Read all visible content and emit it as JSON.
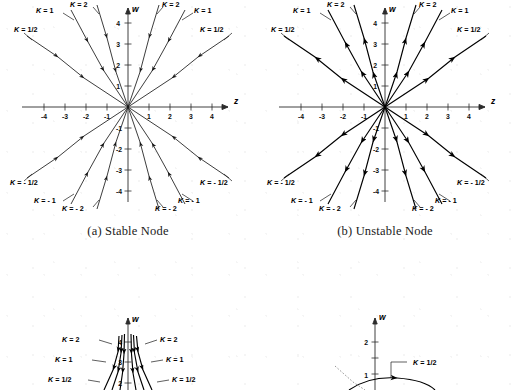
{
  "figure": {
    "background_color": "#ffffff",
    "ink_color": "#000000",
    "panels": [
      {
        "id": "a",
        "caption": "(a) Stable Node",
        "type": "phase-portrait",
        "axis_x_label": "z",
        "axis_y_label": "w",
        "x_ticks": [
          "-4",
          "-3",
          "-2",
          "-1",
          "1",
          "2",
          "3",
          "4"
        ],
        "y_ticks": [
          "4",
          "3",
          "2",
          "1",
          "-1",
          "-2",
          "-3",
          "-4"
        ],
        "flow_direction": "inward",
        "curve_labels": [
          "K = 1/2",
          "K = 1",
          "K = 2",
          "K = 2",
          "K = 1",
          "K = 1/2",
          "K = - 1/2",
          "K = - 1",
          "K = - 2",
          "K = - 2",
          "K = - 1",
          "K = - 1/2"
        ]
      },
      {
        "id": "b",
        "caption": "(b) Unstable Node",
        "type": "phase-portrait",
        "axis_x_label": "z",
        "axis_y_label": "w",
        "x_ticks": [
          "-4",
          "-3",
          "-2",
          "-1",
          "1",
          "2",
          "3",
          "4"
        ],
        "y_ticks": [
          "4",
          "3",
          "2",
          "1",
          "-1",
          "-2",
          "-3",
          "-4"
        ],
        "flow_direction": "outward",
        "curve_labels": [
          "K = 1/2",
          "K = 1",
          "K = 2",
          "K = 2",
          "K = 1",
          "K = 1/2",
          "K = - 1/2",
          "K = - 1",
          "K = - 2",
          "K = - 2",
          "K = - 1",
          "K = - 1/2"
        ]
      },
      {
        "id": "c",
        "caption": "",
        "type": "phase-portrait-partial",
        "axis_y_label": "w",
        "y_ticks": [
          "4",
          "3",
          "2"
        ],
        "curve_labels": [
          "K = 2",
          "K = 1",
          "K = 1/2",
          "K = 2",
          "K = 1",
          "K = 1/2"
        ]
      },
      {
        "id": "d",
        "caption": "",
        "type": "phase-portrait-partial",
        "axis_y_label": "w",
        "y_ticks": [
          "2",
          "1"
        ],
        "curve_labels": [
          "K = 1/2"
        ]
      }
    ]
  },
  "chart_data": {
    "type": "line",
    "xlabel": "z",
    "ylabel": "w",
    "xlim": [
      -4.8,
      4.8
    ],
    "ylim": [
      -4.8,
      4.8
    ],
    "grid": false,
    "legend": "inline-curve-labels",
    "panels": [
      {
        "name": "(a) Stable Node",
        "direction": "trajectories converge toward origin",
        "series": [
          {
            "name": "K = 1/2",
            "endpoint": [
              -4.6,
              3.4
            ],
            "quadrant": "II"
          },
          {
            "name": "K = 1",
            "endpoint": [
              -2.6,
              4.6
            ],
            "quadrant": "II"
          },
          {
            "name": "K = 2",
            "endpoint": [
              -1.5,
              4.8
            ],
            "quadrant": "II"
          },
          {
            "name": "K = 2",
            "endpoint": [
              1.5,
              4.8
            ],
            "quadrant": "I"
          },
          {
            "name": "K = 1",
            "endpoint": [
              2.6,
              4.6
            ],
            "quadrant": "I"
          },
          {
            "name": "K = 1/2",
            "endpoint": [
              4.6,
              3.4
            ],
            "quadrant": "I"
          },
          {
            "name": "K = - 1/2",
            "endpoint": [
              -4.6,
              -3.4
            ],
            "quadrant": "III"
          },
          {
            "name": "K = - 1",
            "endpoint": [
              -2.6,
              -4.6
            ],
            "quadrant": "III"
          },
          {
            "name": "K = - 2",
            "endpoint": [
              -1.5,
              -4.8
            ],
            "quadrant": "III"
          },
          {
            "name": "K = - 2",
            "endpoint": [
              1.5,
              -4.8
            ],
            "quadrant": "IV"
          },
          {
            "name": "K = - 1",
            "endpoint": [
              2.6,
              -4.6
            ],
            "quadrant": "IV"
          },
          {
            "name": "K = - 1/2",
            "endpoint": [
              4.6,
              -3.4
            ],
            "quadrant": "IV"
          }
        ]
      },
      {
        "name": "(b) Unstable Node",
        "direction": "trajectories diverge away from origin",
        "series": [
          {
            "name": "K = 1/2",
            "endpoint": [
              -4.6,
              3.4
            ],
            "quadrant": "II"
          },
          {
            "name": "K = 1",
            "endpoint": [
              -2.6,
              4.6
            ],
            "quadrant": "II"
          },
          {
            "name": "K = 2",
            "endpoint": [
              -1.5,
              4.8
            ],
            "quadrant": "II"
          },
          {
            "name": "K = 2",
            "endpoint": [
              1.5,
              4.8
            ],
            "quadrant": "I"
          },
          {
            "name": "K = 1",
            "endpoint": [
              2.6,
              4.6
            ],
            "quadrant": "I"
          },
          {
            "name": "K = 1/2",
            "endpoint": [
              4.6,
              3.4
            ],
            "quadrant": "I"
          },
          {
            "name": "K = - 1/2",
            "endpoint": [
              -4.6,
              -3.4
            ],
            "quadrant": "III"
          },
          {
            "name": "K = - 1",
            "endpoint": [
              -2.6,
              -4.6
            ],
            "quadrant": "III"
          },
          {
            "name": "K = - 2",
            "endpoint": [
              -1.5,
              -4.8
            ],
            "quadrant": "III"
          },
          {
            "name": "K = - 2",
            "endpoint": [
              1.5,
              -4.8
            ],
            "quadrant": "IV"
          },
          {
            "name": "K = - 1",
            "endpoint": [
              2.6,
              -4.6
            ],
            "quadrant": "IV"
          },
          {
            "name": "K = - 1/2",
            "endpoint": [
              4.6,
              -3.4
            ],
            "quadrant": "IV"
          }
        ]
      }
    ]
  }
}
